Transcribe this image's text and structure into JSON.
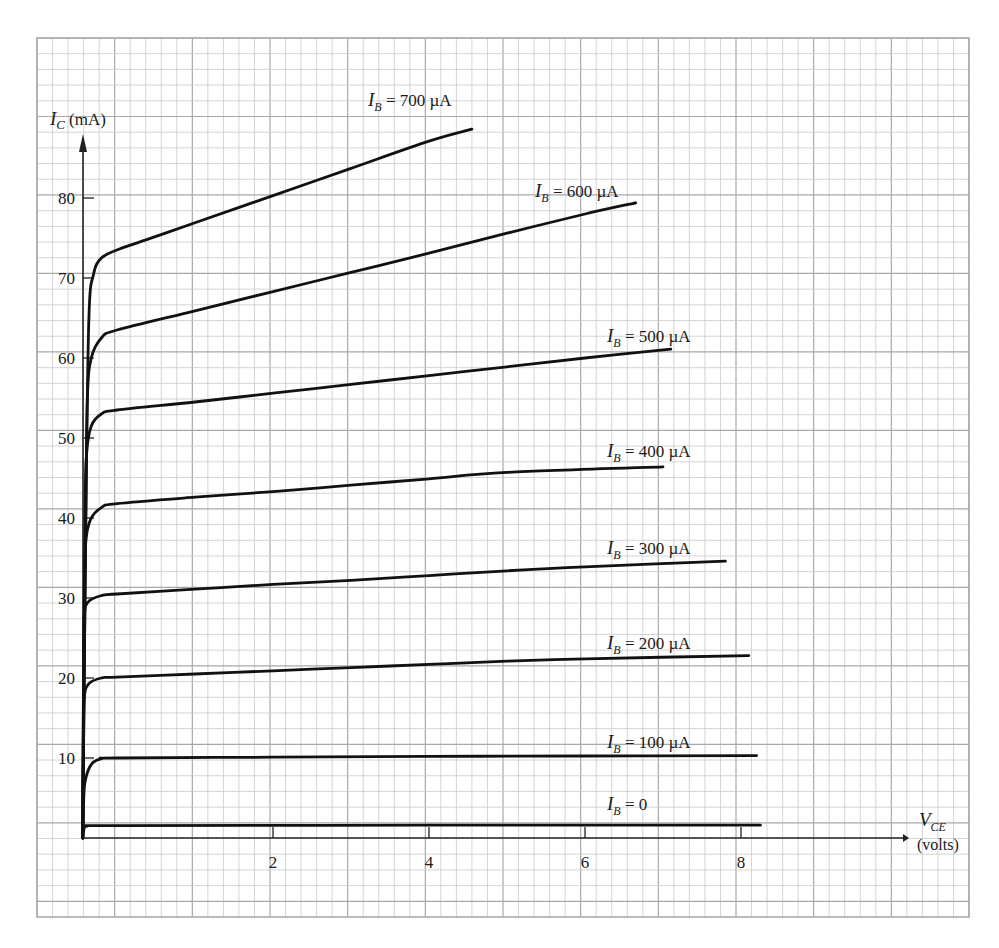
{
  "chart_data": {
    "type": "line",
    "title": "",
    "xlabel": "V_CE (volts)",
    "ylabel": "I_C (mA)",
    "xlim": [
      0,
      8.5
    ],
    "ylim": [
      0,
      90
    ],
    "grid": true,
    "x_ticks": [
      2,
      4,
      6,
      8
    ],
    "x_tick_labels": [
      "2",
      "4",
      "6",
      "8"
    ],
    "y_ticks": [
      10,
      20,
      30,
      40,
      50,
      60,
      70,
      80
    ],
    "y_tick_labels": [
      "10",
      "20",
      "30",
      "40",
      "50",
      "60",
      "70",
      "80"
    ],
    "axis_labels": {
      "y_main": "I",
      "y_sub": "C",
      "y_unit": "(mA)",
      "x_main": "V",
      "x_sub": "CE",
      "x_unit": "(volts)"
    },
    "series": [
      {
        "name": "I_B = 700 µA",
        "label_main": "I",
        "label_sub": "B",
        "label_rest": " = 700 µA",
        "label_pos": [
          368,
          106
        ],
        "points": [
          [
            -0.44,
            0
          ],
          [
            -0.4,
            40
          ],
          [
            -0.36,
            65
          ],
          [
            -0.3,
            70.5
          ],
          [
            -0.2,
            72.5
          ],
          [
            0,
            73.5
          ],
          [
            0.5,
            75.2
          ],
          [
            1,
            76.9
          ],
          [
            2,
            80.3
          ],
          [
            3,
            83.7
          ],
          [
            4,
            87.1
          ],
          [
            4.55,
            88.6
          ]
        ]
      },
      {
        "name": "I_B = 600 µA",
        "label_main": "I",
        "label_sub": "B",
        "label_rest": " = 600 µA",
        "label_pos": [
          535,
          197
        ],
        "points": [
          [
            -0.44,
            0
          ],
          [
            -0.4,
            40
          ],
          [
            -0.38,
            55
          ],
          [
            -0.33,
            60
          ],
          [
            -0.2,
            62.5
          ],
          [
            0,
            63.5
          ],
          [
            1,
            65.9
          ],
          [
            2,
            68.3
          ],
          [
            3,
            70.7
          ],
          [
            4,
            73.1
          ],
          [
            5,
            75.6
          ],
          [
            6,
            78
          ],
          [
            6.65,
            79.4
          ]
        ]
      },
      {
        "name": "I_B = 500 µA",
        "label_main": "I",
        "label_sub": "B",
        "label_rest": " = 500 µA",
        "label_pos": [
          607,
          342
        ],
        "points": [
          [
            -0.44,
            0
          ],
          [
            -0.41,
            40
          ],
          [
            -0.39,
            48
          ],
          [
            -0.33,
            51.5
          ],
          [
            -0.2,
            53
          ],
          [
            0,
            53.5
          ],
          [
            1,
            54.5
          ],
          [
            2,
            55.6
          ],
          [
            3,
            56.7
          ],
          [
            4,
            57.8
          ],
          [
            5,
            58.9
          ],
          [
            6,
            60
          ],
          [
            7.1,
            61.1
          ]
        ]
      },
      {
        "name": "I_B = 400 µA",
        "label_main": "I",
        "label_sub": "B",
        "label_rest": " = 400 µA",
        "label_pos": [
          607,
          457
        ],
        "points": [
          [
            -0.44,
            0
          ],
          [
            -0.42,
            30
          ],
          [
            -0.4,
            37
          ],
          [
            -0.34,
            39.8
          ],
          [
            -0.2,
            41.3
          ],
          [
            0,
            41.8
          ],
          [
            1,
            42.6
          ],
          [
            2,
            43.3
          ],
          [
            3,
            44.1
          ],
          [
            4,
            44.9
          ],
          [
            5,
            45.7
          ],
          [
            7,
            46.4
          ]
        ]
      },
      {
        "name": "I_B = 300 µA",
        "label_main": "I",
        "label_sub": "B",
        "label_rest": " = 300 µA",
        "label_pos": [
          607,
          554
        ],
        "points": [
          [
            -0.44,
            0
          ],
          [
            -0.43,
            20
          ],
          [
            -0.42,
            27.5
          ],
          [
            -0.37,
            29.5
          ],
          [
            -0.2,
            30.3
          ],
          [
            0,
            30.5
          ],
          [
            1,
            31.1
          ],
          [
            2,
            31.7
          ],
          [
            3,
            32.2
          ],
          [
            4,
            32.8
          ],
          [
            5,
            33.4
          ],
          [
            6,
            33.9
          ],
          [
            7.8,
            34.6
          ]
        ]
      },
      {
        "name": "I_B = 200 µA",
        "label_main": "I",
        "label_sub": "B",
        "label_rest": " = 200 µA",
        "label_pos": [
          607,
          649
        ],
        "points": [
          [
            -0.44,
            0
          ],
          [
            -0.43,
            12
          ],
          [
            -0.42,
            17.5
          ],
          [
            -0.36,
            19.3
          ],
          [
            -0.2,
            20
          ],
          [
            0,
            20.1
          ],
          [
            1,
            20.5
          ],
          [
            2,
            20.9
          ],
          [
            3,
            21.3
          ],
          [
            4,
            21.7
          ],
          [
            5,
            22.1
          ],
          [
            6,
            22.4
          ],
          [
            8.1,
            22.8
          ]
        ]
      },
      {
        "name": "I_B = 100 µA",
        "label_main": "I",
        "label_sub": "B",
        "label_rest": " = 100 µA",
        "label_pos": [
          607,
          748
        ],
        "points": [
          [
            -0.44,
            0
          ],
          [
            -0.43,
            4
          ],
          [
            -0.41,
            7
          ],
          [
            -0.33,
            9.2
          ],
          [
            -0.2,
            9.9
          ],
          [
            0,
            10
          ],
          [
            2,
            10.1
          ],
          [
            4,
            10.2
          ],
          [
            6,
            10.25
          ],
          [
            8.2,
            10.3
          ]
        ]
      },
      {
        "name": "I_B = 0",
        "label_main": "I",
        "label_sub": "B",
        "label_rest": " = 0",
        "label_pos": [
          607,
          810
        ],
        "points": [
          [
            -0.44,
            0
          ],
          [
            -0.42,
            1.2
          ],
          [
            -0.38,
            1.5
          ],
          [
            0,
            1.55
          ],
          [
            4,
            1.6
          ],
          [
            8.25,
            1.6
          ]
        ]
      }
    ],
    "legend": null
  },
  "layout": {
    "x_origin_px": 117,
    "px_per_volt": 78,
    "y_origin_px": 838,
    "px_per_mA": 8,
    "axis_x_px": 83,
    "grid": {
      "left": 37,
      "top": 38,
      "right": 969,
      "bottom": 917,
      "minor": 15.6,
      "major_every": 5
    },
    "colors": {
      "grid_minor": "#c9c9c9",
      "grid_major": "#a8a8a8",
      "curve": "#111111",
      "axis": "#222222",
      "text": "#1a1a1a"
    }
  }
}
